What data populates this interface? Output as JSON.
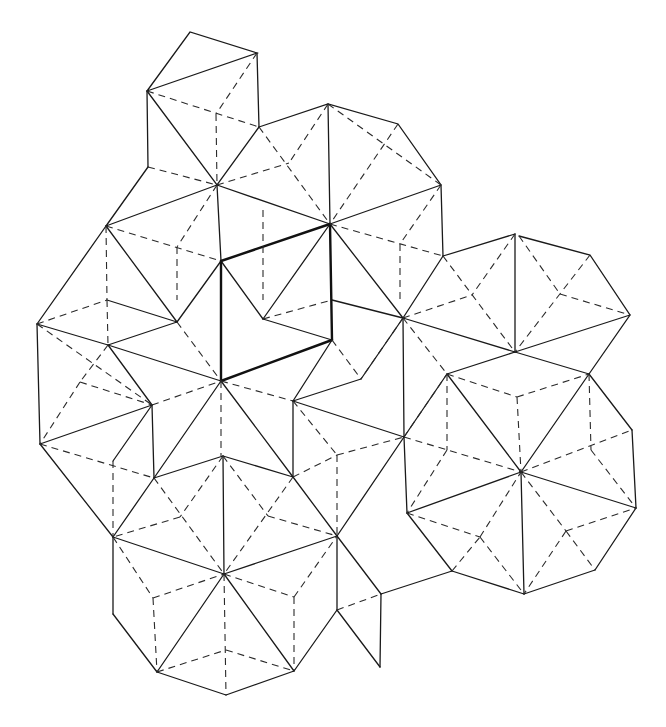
{
  "figure": {
    "line_styles": {
      "solid": "#1a1a1a",
      "dashed": "#2a2a2a",
      "bold": "#111111"
    },
    "background": "#ffffff"
  },
  "points": {
    "T1": [
      190,
      32
    ],
    "T2": [
      257,
      53
    ],
    "T3": [
      147,
      91
    ],
    "T4": [
      259,
      127
    ],
    "T5": [
      148,
      167
    ],
    "A": [
      217,
      185
    ],
    "Bv": [
      330,
      224
    ],
    "C": [
      221,
      261
    ],
    "D": [
      332,
      340
    ],
    "E": [
      221,
      381
    ],
    "F": [
      263,
      319
    ],
    "G": [
      403,
      318
    ],
    "H": [
      293,
      401
    ],
    "I": [
      361,
      379
    ],
    "TT1": [
      328,
      104
    ],
    "TT2": [
      398,
      124
    ],
    "TT3": [
      441,
      185
    ],
    "TT4": [
      443,
      256
    ],
    "K": [
      515,
      234
    ],
    "L": [
      590,
      255
    ],
    "M": [
      630,
      315
    ],
    "N": [
      515,
      352
    ],
    "O": [
      447,
      374
    ],
    "P": [
      589,
      374
    ],
    "R": [
      632,
      430
    ],
    "S": [
      521,
      472
    ],
    "T": [
      407,
      513
    ],
    "U": [
      452,
      571
    ],
    "V": [
      524,
      594
    ],
    "W": [
      595,
      570
    ],
    "X": [
      636,
      508
    ],
    "V1": [
      106,
      226
    ],
    "W1": [
      107,
      300
    ],
    "W2": [
      177,
      322
    ],
    "LM": [
      108,
      345
    ],
    "LL": [
      37,
      324
    ],
    "LN": [
      152,
      405
    ],
    "LO": [
      40,
      444
    ],
    "LP": [
      154,
      478
    ],
    "LQ": [
      113,
      461
    ],
    "AA": [
      404,
      437
    ],
    "BB": [
      293,
      477
    ],
    "DD": [
      407,
      512
    ],
    "Y": [
      224,
      574
    ],
    "Z2": [
      223,
      456
    ],
    "Z4": [
      337,
      536
    ],
    "Z5": [
      113,
      537
    ],
    "Z6": [
      113,
      614
    ],
    "Z7": [
      157,
      672
    ],
    "Z8": [
      226,
      695
    ],
    "Z9": [
      294,
      671
    ],
    "Z10": [
      337,
      610
    ],
    "Z11": [
      381,
      594
    ],
    "Z12": [
      380,
      667
    ]
  }
}
